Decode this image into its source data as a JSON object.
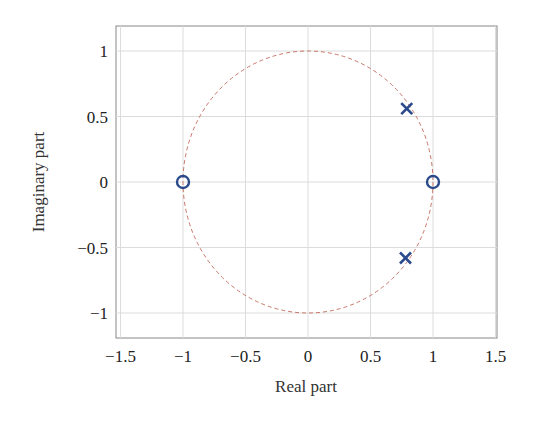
{
  "chart_data": {
    "type": "scatter",
    "title": "",
    "xlabel": "Real part",
    "ylabel": "Imaginary part",
    "xlim": [
      -1.5,
      1.5
    ],
    "ylim": [
      -1.2,
      1.2
    ],
    "grid": true,
    "legend": null,
    "x_ticks": [
      "-1.5",
      "-1",
      "-0.5",
      "0",
      "0.5",
      "1",
      "1.5"
    ],
    "x_tick_values": [
      -1.5,
      -1,
      -0.5,
      0,
      0.5,
      1,
      1.5
    ],
    "y_ticks": [
      "-1",
      "-0.5",
      "0",
      "0.5",
      "1"
    ],
    "y_tick_values": [
      -1,
      -0.5,
      0,
      0.5,
      1
    ],
    "series": [
      {
        "name": "Zeros",
        "marker": "o",
        "color": "#2b4a8b",
        "points": [
          [
            -1,
            0
          ],
          [
            1,
            0
          ]
        ]
      },
      {
        "name": "Poles",
        "marker": "x",
        "color": "#2b4a8b",
        "points": [
          [
            0.79,
            0.56
          ],
          [
            0.78,
            -0.58
          ]
        ]
      },
      {
        "name": "Unit circle",
        "style": "dashed",
        "color": "#c9776b",
        "center": [
          0,
          0
        ],
        "radius": 1
      }
    ]
  },
  "axes": {
    "xlabel": "Real part",
    "ylabel": "Imaginary part"
  },
  "colors": {
    "marker": "#2b4a8b",
    "unit_circle": "#c9776b",
    "grid": "#dcdcdc",
    "frame": "#888888"
  }
}
